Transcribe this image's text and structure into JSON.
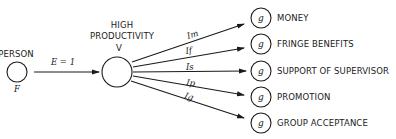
{
  "diagram": {
    "person": {
      "label": "PERSON",
      "symbol": "F"
    },
    "effort_arrow": {
      "label": "E = 1"
    },
    "productivity": {
      "label_line1": "HIGH",
      "label_line2": "PRODUCTIVITY",
      "symbol": "V"
    },
    "instrumentalities": [
      {
        "symbol": "Im"
      },
      {
        "symbol": "If"
      },
      {
        "symbol": "Is"
      },
      {
        "symbol": "Ip"
      },
      {
        "symbol": "Ig"
      }
    ],
    "outcomes": [
      {
        "symbol": "g",
        "label": "MONEY"
      },
      {
        "symbol": "g",
        "label": "FRINGE BENEFITS"
      },
      {
        "symbol": "g",
        "label": "SUPPORT OF SUPERVISOR"
      },
      {
        "symbol": "g",
        "label": "PROMOTION"
      },
      {
        "symbol": "g",
        "label": "GROUP ACCEPTANCE"
      }
    ],
    "colors": {
      "ink": "#1a1a1a",
      "background": "#ffffff"
    }
  }
}
